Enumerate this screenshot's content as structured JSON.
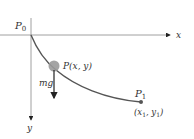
{
  "diagram": {
    "type": "brachistochrone-style curve with falling mass",
    "axes": {
      "x_label": "x",
      "y_label": "y"
    },
    "points": {
      "start": {
        "name": "P",
        "subscript": "0"
      },
      "particle": {
        "label": "P(x, y)"
      },
      "end": {
        "name": "P",
        "subscript": "1",
        "coords_label": "(x",
        "coords_sub1": "1",
        "coords_mid": ", y",
        "coords_sub2": "1",
        "coords_close": ")"
      }
    },
    "force": {
      "label": "mg"
    },
    "colors": {
      "axis": "#777777",
      "curve": "#555555",
      "ball": "#9a9a9a",
      "arrow": "#222222",
      "text": "#333333"
    }
  }
}
